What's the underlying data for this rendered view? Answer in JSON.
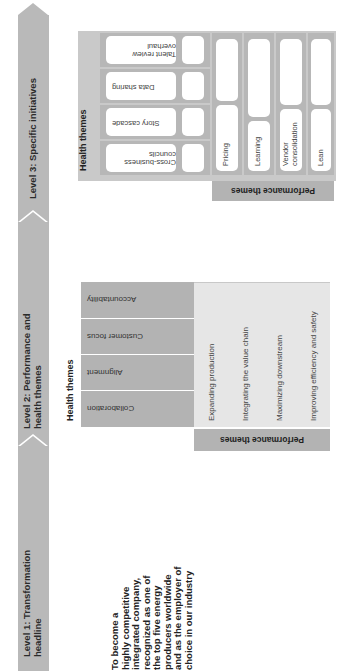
{
  "orientation": "rotated-90-ccw",
  "levels": [
    {
      "label_line1": "Level 1: Transformation",
      "label_line2": "headline"
    },
    {
      "label_line1": "Level 2: Performance and",
      "label_line2": "health themes"
    },
    {
      "label_line1": "Level 3: Specific initiatives",
      "label_line2": ""
    }
  ],
  "headline": {
    "lines": [
      "To become a",
      "highly competitive",
      "integrated company,",
      "recognized as one of",
      "the top five energy",
      "producers worldwide",
      "and as the employer of",
      "choice in our industry"
    ]
  },
  "level2": {
    "health_label": "Health themes",
    "performance_label": "Performance themes",
    "health_themes": [
      "Collaboration",
      "Alignment",
      "Customer focus",
      "Accountability"
    ],
    "performance_themes": [
      "Expanding production",
      "Integrating the value chain",
      "Maximizing  downstream",
      "Improving efficiency and safety"
    ]
  },
  "level3": {
    "health_label": "Health themes",
    "performance_label": "Performance themes",
    "health_initiatives": [
      "Cross-business councils",
      "Story cascade",
      "Data sharing",
      "Talent review overhaul"
    ],
    "performance_initiatives": [
      "Pricing",
      "Learning",
      "Vendor consolidation",
      "Lean"
    ]
  },
  "colors": {
    "band": "#b9b9b9",
    "chevron": "#ffffff",
    "health_cell": "#b3b3b3",
    "performance_cell": "#e6e6e6",
    "level3_frame": "#c9c9c9",
    "pill": "#ffffff"
  }
}
